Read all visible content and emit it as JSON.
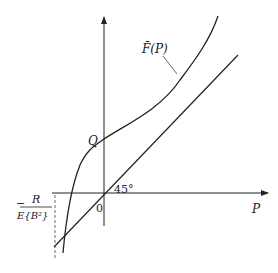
{
  "diagram": {
    "type": "function-plot",
    "axes": {
      "x_label": "P",
      "origin_label": "0",
      "y_intercept_label": "Q"
    },
    "curve": {
      "label": "F̄(P)",
      "description": "S-shaped increasing curve crossing y-axis at Q"
    },
    "line": {
      "description": "45-degree line through origin",
      "angle_label": "45°"
    },
    "x_marker": {
      "numerator": "R",
      "denominator": "E{B²}",
      "sign": "−"
    },
    "colors": {
      "stroke": "#222222",
      "background": "#ffffff"
    }
  }
}
